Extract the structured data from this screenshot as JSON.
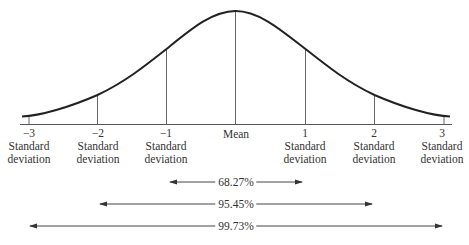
{
  "diagram": {
    "type": "normal-distribution",
    "colors": {
      "curve": "#222222",
      "lines": "#555555",
      "text": "#333333",
      "background": "#ffffff"
    },
    "axis": {
      "ticks": [
        {
          "value": "−3",
          "label1": "Standard",
          "label2": "deviation"
        },
        {
          "value": "−2",
          "label1": "Standard",
          "label2": "deviation"
        },
        {
          "value": "−1",
          "label1": "Standard",
          "label2": "deviation"
        },
        {
          "value": "",
          "label1": "Mean",
          "label2": ""
        },
        {
          "value": "1",
          "label1": "Standard",
          "label2": "deviation"
        },
        {
          "value": "2",
          "label1": "Standard",
          "label2": "deviation"
        },
        {
          "value": "3",
          "label1": "Standard",
          "label2": "deviation"
        }
      ]
    },
    "ranges": [
      {
        "label": "68.27%",
        "from": -1,
        "to": 1
      },
      {
        "label": "95.45%",
        "from": -2,
        "to": 2
      },
      {
        "label": "99.73%",
        "from": -3,
        "to": 3
      }
    ]
  }
}
